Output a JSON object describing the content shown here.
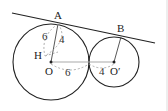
{
  "figure": {
    "points": {
      "A": "A",
      "B": "B",
      "H": "H",
      "O": "O",
      "O_prime": "O′"
    },
    "lengths": {
      "OA_dashed": "6",
      "AH_dashed": "4",
      "OT_dashed": "6",
      "TO_prime_dashed": "4"
    },
    "colors": {
      "stroke": "#222222",
      "center_line": "#aaaaaa",
      "dashed": "#999999"
    }
  }
}
